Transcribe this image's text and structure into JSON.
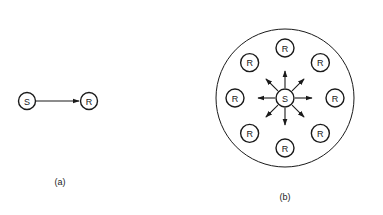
{
  "figures": [
    {
      "id": "a",
      "caption": "(a)",
      "source": {
        "label": "S"
      },
      "receivers": [
        {
          "label": "R"
        }
      ],
      "description": "Single source sends to a single receiver"
    },
    {
      "id": "b",
      "caption": "(b)",
      "source": {
        "label": "S"
      },
      "receivers": [
        {
          "label": "R",
          "direction": "top"
        },
        {
          "label": "R",
          "direction": "top-right"
        },
        {
          "label": "R",
          "direction": "right"
        },
        {
          "label": "R",
          "direction": "bottom-right"
        },
        {
          "label": "R",
          "direction": "bottom"
        },
        {
          "label": "R",
          "direction": "bottom-left"
        },
        {
          "label": "R",
          "direction": "left"
        },
        {
          "label": "R",
          "direction": "top-left"
        }
      ],
      "has_boundary_circle": true,
      "description": "Single source broadcasts to eight receivers within an enclosing region"
    }
  ],
  "colors": {
    "ink": "#1a1a1a",
    "background": "#ffffff"
  }
}
